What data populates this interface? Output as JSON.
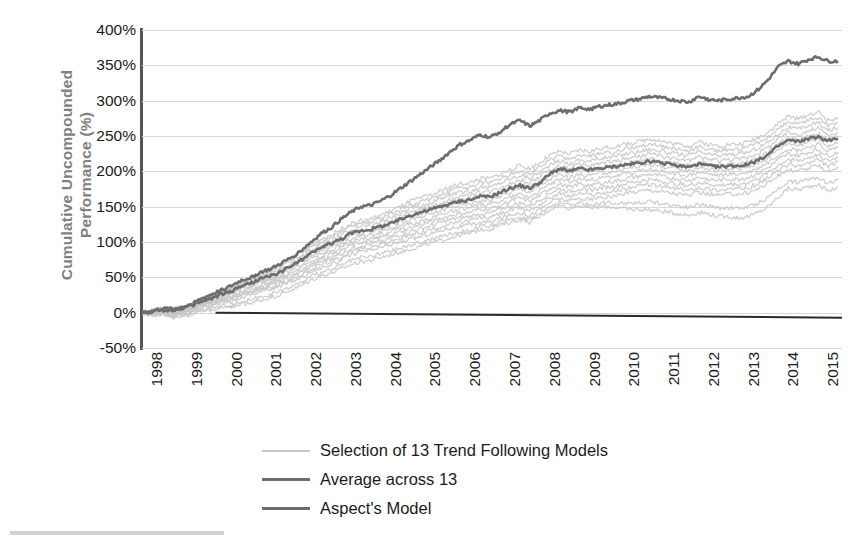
{
  "chart_data": {
    "type": "line",
    "title": "",
    "subtitle": "",
    "xlabel": "",
    "ylabel": "Cumulative Uncompounded Performance (%)",
    "grid": true,
    "legend_position": "bottom-center",
    "xlim": [
      1998,
      2015.6
    ],
    "ylim": [
      -50,
      400
    ],
    "ytick_step": 50,
    "ytick_labels": [
      "400%",
      "350%",
      "300%",
      "250%",
      "200%",
      "150%",
      "100%",
      "50%",
      "0%",
      "-50%"
    ],
    "ytick_values": [
      400,
      350,
      300,
      250,
      200,
      150,
      100,
      50,
      0,
      -50
    ],
    "xtick_labels": [
      "1998",
      "1999",
      "2000",
      "2001",
      "2002",
      "2003",
      "2004",
      "2005",
      "2006",
      "2007",
      "2008",
      "2009",
      "2010",
      "2011",
      "2012",
      "2013",
      "2014",
      "2015"
    ],
    "xtick_values": [
      1998,
      1999,
      2000,
      2001,
      2002,
      2003,
      2004,
      2005,
      2006,
      2007,
      2008,
      2009,
      2010,
      2011,
      2012,
      2013,
      2014,
      2015
    ],
    "zero_reference_line": 0,
    "colors": {
      "models_band": "#c6c6c6",
      "average": "#6d6d6d",
      "aspect": "#6d6d6d",
      "gridline": "#d8d8d8",
      "axis": "#555555",
      "zero_line": "#2b2b2b",
      "ylabel_text": "#808080",
      "tick_text": "#1b1b1b"
    },
    "x": [
      1998.0,
      1998.25,
      1998.5,
      1998.75,
      1999.0,
      1999.25,
      1999.5,
      1999.75,
      2000.0,
      2000.25,
      2000.5,
      2000.75,
      2001.0,
      2001.25,
      2001.5,
      2001.75,
      2002.0,
      2002.25,
      2002.5,
      2002.75,
      2003.0,
      2003.25,
      2003.5,
      2003.75,
      2004.0,
      2004.25,
      2004.5,
      2004.75,
      2005.0,
      2005.25,
      2005.5,
      2005.75,
      2006.0,
      2006.25,
      2006.5,
      2006.75,
      2007.0,
      2007.25,
      2007.5,
      2007.75,
      2008.0,
      2008.25,
      2008.5,
      2008.75,
      2009.0,
      2009.25,
      2009.5,
      2009.75,
      2010.0,
      2010.25,
      2010.5,
      2010.75,
      2011.0,
      2011.25,
      2011.5,
      2011.75,
      2012.0,
      2012.25,
      2012.5,
      2012.75,
      2013.0,
      2013.25,
      2013.5,
      2013.75,
      2014.0,
      2014.25,
      2014.5,
      2014.75,
      2015.0,
      2015.25,
      2015.5
    ],
    "series": [
      {
        "name": "Aspect's Model",
        "style": "solid-dark",
        "width": 2.6,
        "color": "#6d6d6d",
        "values": [
          0,
          2,
          6,
          5,
          8,
          12,
          20,
          26,
          32,
          38,
          46,
          50,
          58,
          62,
          70,
          78,
          88,
          100,
          112,
          120,
          132,
          142,
          150,
          152,
          158,
          166,
          176,
          186,
          196,
          206,
          216,
          228,
          238,
          244,
          252,
          248,
          256,
          266,
          272,
          264,
          272,
          282,
          286,
          284,
          290,
          288,
          292,
          294,
          296,
          300,
          302,
          306,
          304,
          302,
          300,
          298,
          306,
          302,
          300,
          302,
          304,
          306,
          316,
          330,
          348,
          356,
          352,
          358,
          362,
          356,
          356
        ]
      },
      {
        "name": "Average across 13",
        "style": "solid-dark",
        "width": 2.6,
        "color": "#6d6d6d",
        "values": [
          0,
          1,
          4,
          3,
          6,
          10,
          16,
          20,
          26,
          30,
          38,
          42,
          48,
          52,
          58,
          66,
          74,
          84,
          92,
          98,
          104,
          112,
          116,
          118,
          122,
          126,
          132,
          138,
          142,
          146,
          150,
          154,
          158,
          160,
          164,
          164,
          170,
          176,
          180,
          176,
          184,
          196,
          204,
          200,
          204,
          202,
          204,
          206,
          208,
          210,
          212,
          214,
          212,
          210,
          208,
          206,
          210,
          208,
          206,
          208,
          208,
          210,
          216,
          224,
          236,
          244,
          242,
          246,
          248,
          244,
          246
        ]
      },
      {
        "name": "Selection of 13 Trend Following Models (upper envelope)",
        "style": "solid-light",
        "width": 1.5,
        "color": "#c6c6c6",
        "values": [
          0,
          3,
          7,
          6,
          9,
          13,
          20,
          25,
          31,
          36,
          44,
          48,
          55,
          60,
          68,
          76,
          86,
          96,
          104,
          110,
          118,
          126,
          130,
          132,
          138,
          144,
          150,
          158,
          162,
          166,
          172,
          178,
          182,
          184,
          190,
          190,
          196,
          202,
          208,
          204,
          212,
          222,
          228,
          224,
          230,
          228,
          232,
          234,
          236,
          240,
          242,
          246,
          244,
          240,
          238,
          236,
          242,
          238,
          236,
          238,
          238,
          242,
          248,
          256,
          268,
          278,
          274,
          280,
          284,
          272,
          276
        ]
      },
      {
        "name": "Selection of 13 Trend Following Models (lower envelope)",
        "style": "solid-light",
        "width": 1.5,
        "color": "#c6c6c6",
        "values": [
          0,
          -2,
          -1,
          -4,
          -2,
          2,
          8,
          10,
          14,
          16,
          22,
          26,
          30,
          34,
          38,
          44,
          50,
          58,
          64,
          68,
          74,
          82,
          86,
          88,
          92,
          96,
          100,
          104,
          108,
          112,
          116,
          120,
          122,
          124,
          128,
          128,
          134,
          138,
          142,
          138,
          146,
          156,
          162,
          158,
          162,
          160,
          162,
          164,
          166,
          170,
          172,
          174,
          172,
          170,
          168,
          166,
          170,
          168,
          166,
          168,
          168,
          170,
          176,
          184,
          194,
          202,
          200,
          204,
          208,
          200,
          206
        ]
      },
      {
        "name": "Selection of 13 Trend Following Models (laggard)",
        "style": "solid-light",
        "width": 1.5,
        "color": "#c6c6c6",
        "values": [
          0,
          -4,
          -3,
          -7,
          -5,
          -2,
          2,
          4,
          6,
          8,
          12,
          14,
          18,
          22,
          26,
          32,
          38,
          46,
          52,
          56,
          62,
          68,
          72,
          74,
          78,
          82,
          86,
          90,
          94,
          98,
          102,
          106,
          110,
          112,
          118,
          118,
          124,
          128,
          132,
          128,
          136,
          146,
          152,
          148,
          152,
          148,
          150,
          150,
          148,
          146,
          146,
          146,
          144,
          142,
          140,
          138,
          142,
          140,
          136,
          136,
          134,
          136,
          142,
          150,
          164,
          176,
          174,
          178,
          182,
          172,
          178
        ]
      }
    ]
  },
  "legend": {
    "items": [
      {
        "label": "Selection of 13 Trend Following Models",
        "color": "#c6c6c6",
        "thickness": "2px"
      },
      {
        "label": "Average across 13",
        "color": "#6d6d6d",
        "thickness": "3px"
      },
      {
        "label": "Aspect's Model",
        "color": "#6d6d6d",
        "thickness": "3px"
      }
    ]
  }
}
